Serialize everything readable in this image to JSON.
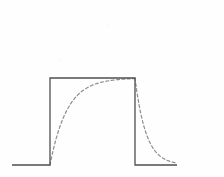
{
  "figure": {
    "title": "",
    "background_color": "#fefefe",
    "width": 224,
    "height": 177
  },
  "chart_data": {
    "type": "line",
    "title": "",
    "subtitle": "",
    "xlabel": "",
    "ylabel": "",
    "xlim": [
      0,
      224
    ],
    "ylim": [
      0,
      177
    ],
    "grid": false,
    "legend_position": "none",
    "axis_ticks": [],
    "tick_labels": [],
    "annotations": [],
    "series": [
      {
        "name": "input-pulse",
        "style": "solid",
        "color": "#4f4f52",
        "line_width": 1.3,
        "description": "rectangular pulse, baseline low, single high plateau",
        "points": [
          [
            12,
            165
          ],
          [
            50,
            165
          ],
          [
            50,
            78
          ],
          [
            135,
            78
          ],
          [
            135,
            165
          ],
          [
            177,
            165
          ]
        ]
      },
      {
        "name": "exponential-response",
        "style": "dashed",
        "color": "#8d8d93",
        "line_width": 1.2,
        "dash_pattern": [
          3,
          2.4
        ],
        "description": "RC charge then discharge response overlaid on pulse",
        "charge": {
          "x_start": 50,
          "x_end": 135,
          "y_start": 165,
          "y_asymptote": 78,
          "time_constant_px": 17
        },
        "discharge": {
          "x_start": 135,
          "x_end": 177,
          "y_start": 78,
          "y_asymptote": 165,
          "time_constant_px": 11
        }
      }
    ],
    "levels": {
      "baseline_y": 165,
      "plateau_y": 78,
      "rising_edge_x": 50,
      "falling_edge_x": 135,
      "trace_left_x": 12,
      "trace_right_x": 177
    }
  },
  "colors": {
    "pulse_stroke": "#4f4f52",
    "response_stroke": "#8d8d93",
    "background": "#fefefe"
  }
}
